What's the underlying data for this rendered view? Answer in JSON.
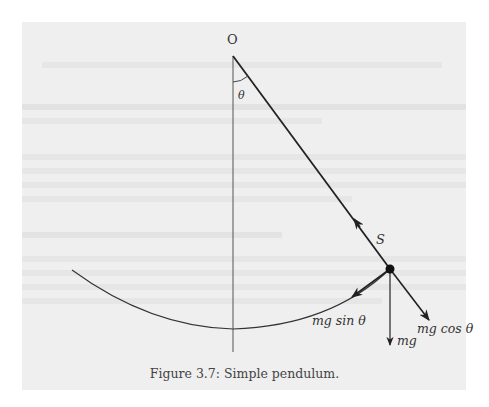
{
  "figure": {
    "caption": "Figure 3.7: Simple pendulum.",
    "labels": {
      "origin": "O",
      "angle": "θ",
      "tension": "S",
      "tangential_force": "mg sin θ",
      "weight": "mg",
      "radial_force": "mg cos θ"
    },
    "colors": {
      "page_background": "#efefef",
      "outer_background": "#ffffff",
      "ink": "#222222",
      "ghost_text": "#e6e6e6"
    }
  },
  "geometry": {
    "pivot": [
      233,
      56
    ],
    "bob": [
      390,
      269
    ],
    "arc_start": [
      72,
      270
    ],
    "arc_bottom": [
      233,
      329
    ],
    "tension_arrow_at": [
      355,
      220
    ],
    "mg_tip": [
      390,
      345
    ],
    "mg_cos_tip": [
      429,
      320
    ],
    "mg_sin_tip": [
      352,
      297
    ]
  }
}
